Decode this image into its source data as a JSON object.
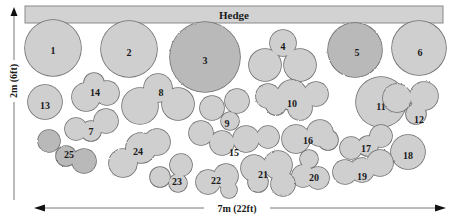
{
  "hedge": {
    "label": "Hedge"
  },
  "dimensions": {
    "height_label": "2m (6ft)",
    "width_label": "7m (22ft)"
  },
  "colors": {
    "fill_light": "#cfcfcf",
    "fill_dark": "#b9b9b9",
    "stroke": "#6e6e6e",
    "hedge_fill": "#d2d2d2",
    "text": "#1a1a1a"
  },
  "plants": [
    {
      "id": "1",
      "label": "1",
      "shape": "circle",
      "tone": "light"
    },
    {
      "id": "2",
      "label": "2",
      "shape": "circle",
      "tone": "light"
    },
    {
      "id": "3",
      "label": "3",
      "shape": "circle-scalloped",
      "tone": "dark"
    },
    {
      "id": "4",
      "label": "4",
      "shape": "trefoil",
      "tone": "light"
    },
    {
      "id": "5",
      "label": "5",
      "shape": "circle-scalloped",
      "tone": "dark"
    },
    {
      "id": "6",
      "label": "6",
      "shape": "circle",
      "tone": "light"
    },
    {
      "id": "7",
      "label": "7",
      "shape": "cluster",
      "tone": "light"
    },
    {
      "id": "8",
      "label": "8",
      "shape": "trefoil",
      "tone": "light"
    },
    {
      "id": "9",
      "label": "9",
      "shape": "cluster",
      "tone": "light"
    },
    {
      "id": "10",
      "label": "10",
      "shape": "cloud",
      "tone": "light"
    },
    {
      "id": "11",
      "label": "11",
      "shape": "circle",
      "tone": "light"
    },
    {
      "id": "12",
      "label": "12",
      "shape": "cloud",
      "tone": "light"
    },
    {
      "id": "13",
      "label": "13",
      "shape": "circle",
      "tone": "light"
    },
    {
      "id": "14",
      "label": "14",
      "shape": "cluster",
      "tone": "light"
    },
    {
      "id": "15",
      "label": "15",
      "shape": "cluster",
      "tone": "light"
    },
    {
      "id": "16",
      "label": "16",
      "shape": "cluster",
      "tone": "light"
    },
    {
      "id": "17",
      "label": "17",
      "shape": "cluster",
      "tone": "light"
    },
    {
      "id": "18",
      "label": "18",
      "shape": "circle",
      "tone": "light"
    },
    {
      "id": "19",
      "label": "19",
      "shape": "cloud",
      "tone": "light"
    },
    {
      "id": "20",
      "label": "20",
      "shape": "cluster",
      "tone": "light"
    },
    {
      "id": "21",
      "label": "21",
      "shape": "cloud",
      "tone": "light"
    },
    {
      "id": "22",
      "label": "22",
      "shape": "cluster",
      "tone": "light"
    },
    {
      "id": "23",
      "label": "23",
      "shape": "cluster",
      "tone": "light"
    },
    {
      "id": "24",
      "label": "24",
      "shape": "cloud",
      "tone": "light"
    },
    {
      "id": "25",
      "label": "25",
      "shape": "cloud",
      "tone": "dark"
    }
  ]
}
